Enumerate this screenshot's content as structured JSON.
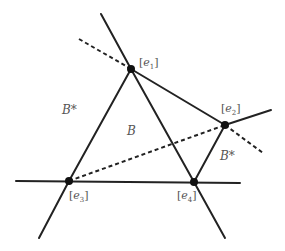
{
  "diagram": {
    "vertices": [
      {
        "id": "e1",
        "label_bracket_open": "[",
        "label_var": "e",
        "label_sub": "1",
        "label_bracket_close": "]",
        "x": 131,
        "y": 69
      },
      {
        "id": "e2",
        "label_bracket_open": "[",
        "label_var": "e",
        "label_sub": "2",
        "label_bracket_close": "]",
        "x": 225,
        "y": 125
      },
      {
        "id": "e3",
        "label_bracket_open": "[",
        "label_var": "e",
        "label_sub": "3",
        "label_bracket_close": "]",
        "x": 69,
        "y": 181
      },
      {
        "id": "e4",
        "label_bracket_open": "[",
        "label_var": "e",
        "label_sub": "4",
        "label_bracket_close": "]",
        "x": 194,
        "y": 182
      }
    ],
    "regions": [
      {
        "id": "B-star-left",
        "label": "B*"
      },
      {
        "id": "B-center",
        "label": "B"
      },
      {
        "id": "B-star-right",
        "label": "B*"
      }
    ],
    "solid_lines": [
      {
        "from": "(101,14)",
        "to": "e1"
      },
      {
        "from": "e1",
        "to": "e4"
      },
      {
        "from": "e4",
        "to": "(225,238)"
      },
      {
        "from": "e1",
        "to": "e3"
      },
      {
        "from": "e3",
        "to": "(39,238)"
      },
      {
        "from": "e1",
        "to": "e2"
      },
      {
        "from": "e2",
        "to": "(271,110)"
      },
      {
        "from": "e2",
        "to": "e4"
      },
      {
        "from": "(16,181)",
        "to": "(240,183)"
      }
    ],
    "dashed_lines": [
      {
        "from": "(79,39)",
        "to": "e1"
      },
      {
        "from": "e2",
        "to": "(263,153)"
      },
      {
        "from": "e3",
        "to": "e2"
      }
    ],
    "colors": {
      "line": "#222222",
      "label": "#555555",
      "background": "#ffffff"
    }
  }
}
